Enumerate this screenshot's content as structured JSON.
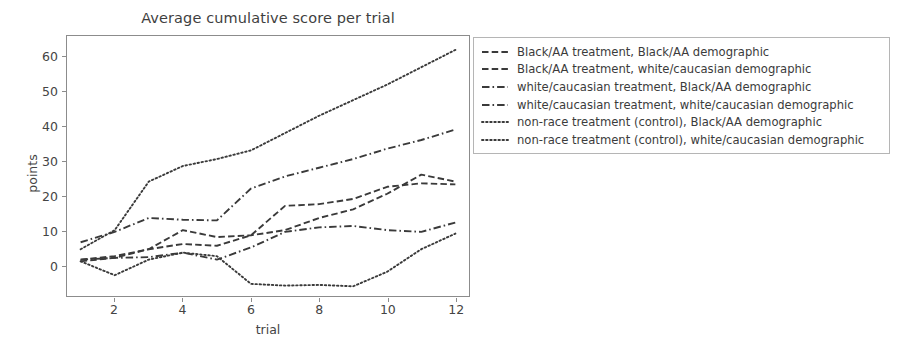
{
  "chart_data": {
    "type": "line",
    "title": "Average cumulative score per trial",
    "xlabel": "trial",
    "ylabel": "points",
    "xlim": [
      0.6,
      12.4
    ],
    "ylim": [
      -9,
      66
    ],
    "xticks": [
      2,
      4,
      6,
      8,
      10,
      12
    ],
    "yticks": [
      0,
      10,
      20,
      30,
      40,
      50,
      60
    ],
    "grid": false,
    "legend_position": "right-outside",
    "x": [
      1,
      2,
      3,
      4,
      5,
      6,
      7,
      8,
      9,
      10,
      11,
      12
    ],
    "series": [
      {
        "name": "Black/AA treatment, Black/AA demographic",
        "linestyle": "dashed",
        "color": "#3a3a3a",
        "values": [
          1.5,
          2.5,
          4.5,
          6.0,
          5.5,
          8.5,
          17.0,
          17.5,
          19.0,
          22.5,
          23.5,
          23.2
        ]
      },
      {
        "name": "Black/AA treatment, white/caucasian demographic",
        "linestyle": "dashed",
        "color": "#3a3a3a",
        "values": [
          1.0,
          2.0,
          4.5,
          10.0,
          8.0,
          8.5,
          10.0,
          13.5,
          16.0,
          20.5,
          26.0,
          24.0
        ]
      },
      {
        "name": "white/caucasian treatment, Black/AA demographic",
        "linestyle": "dashdot",
        "color": "#3a3a3a",
        "values": [
          6.5,
          9.5,
          13.5,
          13.0,
          12.8,
          22.0,
          25.5,
          28.0,
          30.5,
          33.5,
          36.0,
          39.0
        ]
      },
      {
        "name": "white/caucasian treatment, white/caucasian demographic",
        "linestyle": "dashdot",
        "color": "#3a3a3a",
        "values": [
          1.5,
          2.0,
          2.2,
          3.5,
          1.5,
          5.0,
          9.5,
          10.8,
          11.2,
          10.0,
          9.5,
          12.2
        ]
      },
      {
        "name": "non-race treatment (control), Black/AA demographic",
        "linestyle": "dotted",
        "color": "#3a3a3a",
        "values": [
          4.5,
          10.0,
          24.0,
          28.5,
          30.5,
          33.0,
          38.0,
          43.0,
          47.5,
          52.0,
          57.0,
          62.0
        ]
      },
      {
        "name": "non-race treatment (control), white/caucasian demographic",
        "linestyle": "dotted",
        "color": "#3a3a3a",
        "values": [
          1.0,
          -3.0,
          1.5,
          3.5,
          2.5,
          -5.5,
          -6.0,
          -5.8,
          -6.2,
          -2.0,
          4.5,
          9.0
        ]
      }
    ]
  },
  "axes": {
    "ytick_labels": [
      "60",
      "50",
      "40",
      "30",
      "20",
      "10",
      "0"
    ],
    "xtick_labels": [
      "2",
      "4",
      "6",
      "8",
      "10",
      "12"
    ]
  },
  "legend": {
    "items": [
      {
        "label": "Black/AA treatment, Black/AA demographic",
        "style": "dashed"
      },
      {
        "label": "Black/AA treatment, white/caucasian demographic",
        "style": "dashed"
      },
      {
        "label": "white/caucasian treatment, Black/AA demographic",
        "style": "dashdot"
      },
      {
        "label": "white/caucasian treatment, white/caucasian demographic",
        "style": "dashdot"
      },
      {
        "label": "non-race treatment (control), Black/AA demographic",
        "style": "dotted"
      },
      {
        "label": "non-race treatment (control), white/caucasian demographic",
        "style": "dotted"
      }
    ]
  },
  "style": {
    "line_color": "#3a3a3a",
    "axis_color": "#8c8c8c",
    "text_color": "#3f3f3f",
    "background": "#ffffff"
  }
}
